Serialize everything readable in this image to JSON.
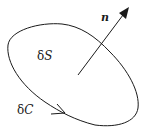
{
  "diagram": {
    "type": "surface-element-with-normal",
    "labels": {
      "surface": "δS",
      "boundary": "δC",
      "normal": "n"
    },
    "colors": {
      "stroke": "#1a1a1a",
      "background": "#ffffff"
    }
  }
}
